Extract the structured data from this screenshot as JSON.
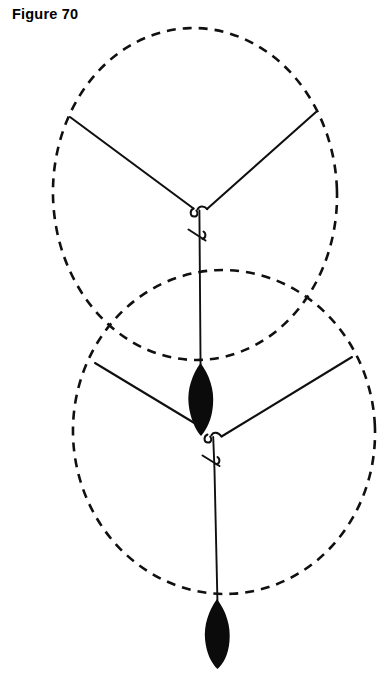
{
  "figure": {
    "caption": "Figure 70",
    "kind": "technical-line-drawing",
    "background_color": "#ffffff",
    "ink_color": "#101010",
    "fill_color": "#0b0b0b",
    "width": 389,
    "height": 676
  },
  "diagram_data": {
    "type": "line-drawing",
    "description": "Two overlapping dashed elliptical canopies, each with a three-point suspension bridle converging to a knot on a common vertical line, with two solid black teardrop weights suspended below.",
    "canopies": [
      {
        "name": "upper-canopy",
        "style": "dashed",
        "cx": 195,
        "cy": 194,
        "rx": 142,
        "ry": 166,
        "bounds": {
          "left": 53,
          "top": 28,
          "right": 337,
          "bottom": 360
        }
      },
      {
        "name": "lower-canopy",
        "style": "dashed",
        "cx": 224,
        "cy": 432,
        "rx": 151,
        "ry": 162,
        "bounds": {
          "left": 73,
          "top": 270,
          "right": 375,
          "bottom": 594
        }
      }
    ],
    "bridles": [
      {
        "name": "upper-bridle",
        "knot": {
          "x": 200,
          "y": 211
        },
        "arms": [
          {
            "name": "upper-bridle-arm-left",
            "from": {
              "x": 70,
              "y": 117
            },
            "to": {
              "x": 193,
              "y": 208
            }
          },
          {
            "name": "upper-bridle-arm-right",
            "from": {
              "x": 316,
              "y": 112
            },
            "to": {
              "x": 208,
              "y": 209
            }
          }
        ]
      },
      {
        "name": "lower-bridle",
        "knot": {
          "x": 213,
          "y": 440
        },
        "arms": [
          {
            "name": "lower-bridle-arm-left",
            "from": {
              "x": 95,
              "y": 363
            },
            "to": {
              "x": 196,
              "y": 424
            }
          },
          {
            "name": "lower-bridle-arm-right",
            "from": {
              "x": 352,
              "y": 357
            },
            "to": {
              "x": 221,
              "y": 436
            }
          }
        ]
      }
    ],
    "risers": [
      {
        "name": "upper-riser",
        "from": {
          "x": 200,
          "y": 212
        },
        "to": {
          "x": 200,
          "y": 368
        }
      },
      {
        "name": "lower-riser",
        "from": {
          "x": 213,
          "y": 441
        },
        "to": {
          "x": 218,
          "y": 604
        }
      }
    ],
    "barbs": [
      {
        "name": "upper-barb",
        "x": 198,
        "y": 236
      },
      {
        "name": "lower-barb",
        "x": 211,
        "y": 461
      }
    ],
    "weights": [
      {
        "name": "upper-weight",
        "cx": 200,
        "top": 364,
        "bottom": 436,
        "max_width": 27,
        "fill": "#0b0b0b"
      },
      {
        "name": "lower-weight",
        "cx": 217,
        "top": 600,
        "bottom": 668,
        "max_width": 27,
        "fill": "#0b0b0b"
      }
    ]
  }
}
